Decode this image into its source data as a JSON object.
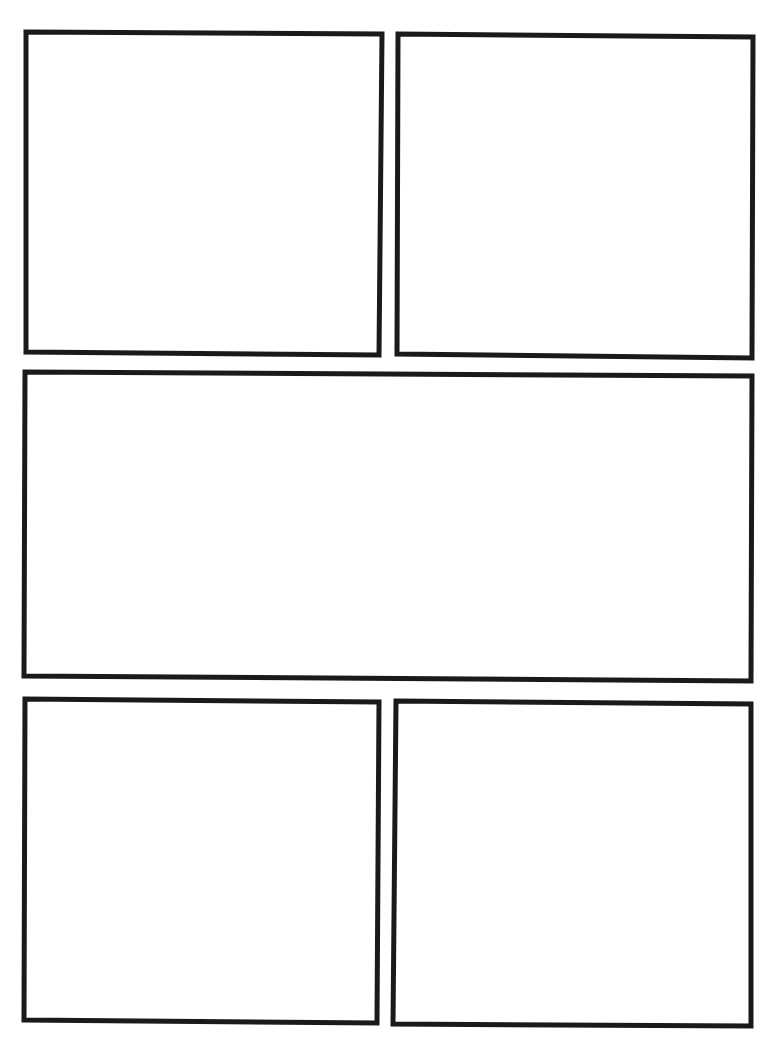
{
  "page": {
    "type": "comic-page-template",
    "background": "#ffffff",
    "border_color": "#1a1a1a",
    "border_width": 5
  },
  "panels": [
    {
      "id": "panel-1",
      "label": "",
      "points": [
        [
          26,
          32
        ],
        [
          382,
          34
        ],
        [
          379,
          355
        ],
        [
          26,
          352
        ]
      ]
    },
    {
      "id": "panel-2",
      "label": "",
      "points": [
        [
          398,
          34
        ],
        [
          753,
          37
        ],
        [
          752,
          358
        ],
        [
          397,
          354
        ]
      ]
    },
    {
      "id": "panel-3",
      "label": "",
      "points": [
        [
          25,
          372
        ],
        [
          752,
          376
        ],
        [
          751,
          681
        ],
        [
          24,
          676
        ]
      ]
    },
    {
      "id": "panel-4",
      "label": "",
      "points": [
        [
          25,
          699
        ],
        [
          379,
          702
        ],
        [
          377,
          1023
        ],
        [
          24,
          1020
        ]
      ]
    },
    {
      "id": "panel-5",
      "label": "",
      "points": [
        [
          396,
          701
        ],
        [
          751,
          704
        ],
        [
          751,
          1026
        ],
        [
          393,
          1024
        ]
      ]
    }
  ]
}
